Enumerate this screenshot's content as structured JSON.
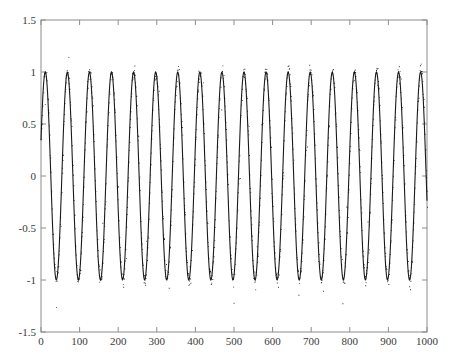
{
  "chart_data": {
    "type": "scatter",
    "title": "",
    "subtitle": "",
    "xlabel": "",
    "ylabel": "",
    "xlim": [
      0,
      1000
    ],
    "ylim": [
      -1.5,
      1.5
    ],
    "grid": false,
    "legend": null,
    "legend_position": "none",
    "xticks": [
      0,
      100,
      200,
      300,
      400,
      500,
      600,
      700,
      800,
      900,
      1000
    ],
    "xtick_labels": [
      "0",
      "100",
      "200",
      "300",
      "400",
      "500",
      "600",
      "700",
      "800",
      "900",
      "1000"
    ],
    "yticks": [
      -1.5,
      -1,
      -0.5,
      0,
      0.5,
      1,
      1.5
    ],
    "ytick_labels": [
      "-1.5",
      "-1",
      "-0.5",
      "0",
      "0.5",
      "1",
      "1.5"
    ],
    "axes_style": {
      "frame": "full-box",
      "tick_direction": "in",
      "axis_color": "#8c8c8c",
      "tick_label_color": "#3a3a3a"
    },
    "series": [
      {
        "name": "noisy sine",
        "type": "scatter",
        "marker": "point",
        "color": "#1a1a1a",
        "n_points": 1000,
        "description": "sin(2*pi*x/57.2) sampled at integer x from 0 to 1000 with additive gaussian noise (sigma about 0.045) plus sparse outliers reaching about +/-1.3",
        "amplitude": 1.0,
        "period": 57.2,
        "cycles": 17.5,
        "phase": 0.35,
        "offset": 0.0,
        "noise_sigma": 0.045,
        "outlier_fraction": 0.03,
        "outlier_spread": 0.3
      }
    ]
  },
  "figure": {
    "background_color": "#ffffff",
    "plot_left": 41,
    "plot_top": 20,
    "plot_right": 427,
    "plot_bottom": 332
  }
}
